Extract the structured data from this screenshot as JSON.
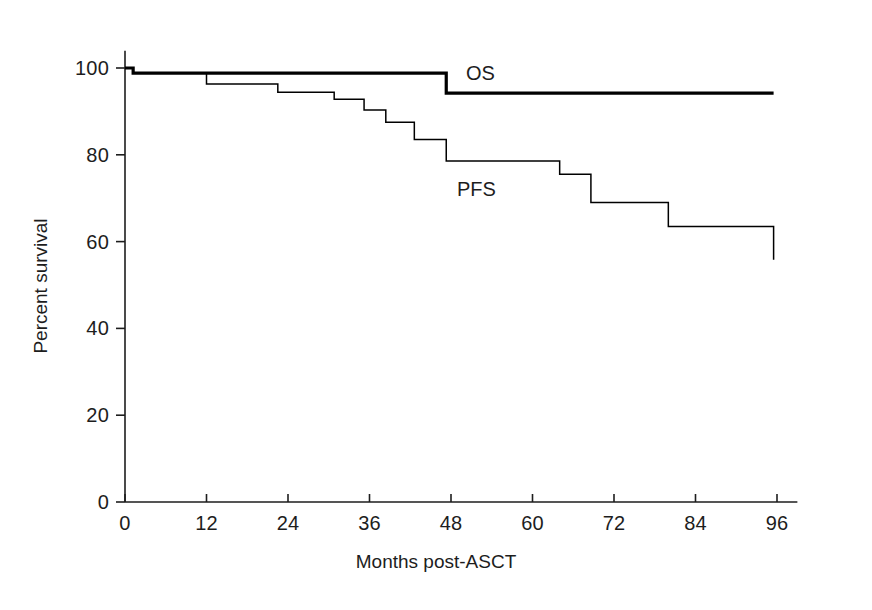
{
  "chart_data": {
    "type": "line",
    "title": "",
    "subtitle": "",
    "xlabel": "Months post-ASCT",
    "ylabel": "Percent survival",
    "xlim": [
      0,
      99
    ],
    "ylim": [
      0,
      104
    ],
    "xticks": [
      0,
      12,
      24,
      36,
      48,
      60,
      72,
      84,
      96
    ],
    "xticklabels": [
      "0",
      "12",
      "24",
      "36",
      "48",
      "60",
      "72",
      "84",
      "96"
    ],
    "yticks": [
      0,
      20,
      40,
      60,
      80,
      100
    ],
    "yticklabels": [
      "0",
      "20",
      "40",
      "60",
      "80",
      "100"
    ],
    "grid": false,
    "legend": "inline-annotations",
    "step_type": "post",
    "series": [
      {
        "name": "OS",
        "label": "OS",
        "color": "#000000",
        "linewidth": 3.2,
        "annotation": "OS",
        "annotation_x": 50.2,
        "annotation_y": 99.5,
        "x": [
          0,
          1.2,
          47.3,
          95.5
        ],
        "y": [
          100,
          98.8,
          98.8,
          94.2
        ],
        "points": [
          {
            "x": 0,
            "y": 100
          },
          {
            "x": 1.2,
            "y": 98.8
          },
          {
            "x": 47.3,
            "y": 94.2
          },
          {
            "x": 95.5,
            "y": 94.2
          }
        ]
      },
      {
        "name": "PFS",
        "label": "PFS",
        "color": "#000000",
        "linewidth": 1.5,
        "annotation": "PFS",
        "annotation_x": 48.9,
        "annotation_y": 74.5,
        "x": [
          0,
          1.2,
          12.0,
          22.5,
          30.8,
          35.2,
          38.4,
          42.6,
          47.3,
          64.0,
          68.6,
          80.0,
          95.5
        ],
        "y": [
          100,
          98.8,
          96.3,
          94.4,
          92.8,
          90.3,
          87.5,
          83.5,
          78.6,
          75.5,
          69.0,
          63.5,
          55.8
        ],
        "points": [
          {
            "x": 0,
            "y": 100
          },
          {
            "x": 1.2,
            "y": 98.8
          },
          {
            "x": 12.0,
            "y": 96.3
          },
          {
            "x": 22.5,
            "y": 94.4
          },
          {
            "x": 30.8,
            "y": 92.8
          },
          {
            "x": 35.2,
            "y": 90.3
          },
          {
            "x": 38.4,
            "y": 87.5
          },
          {
            "x": 42.6,
            "y": 83.5
          },
          {
            "x": 47.3,
            "y": 78.6
          },
          {
            "x": 64.0,
            "y": 75.5
          },
          {
            "x": 68.6,
            "y": 69.0
          },
          {
            "x": 80.0,
            "y": 63.5
          },
          {
            "x": 95.5,
            "y": 55.8
          }
        ]
      }
    ],
    "axis_color": "#1d1d1d",
    "background": "#ffffff"
  }
}
